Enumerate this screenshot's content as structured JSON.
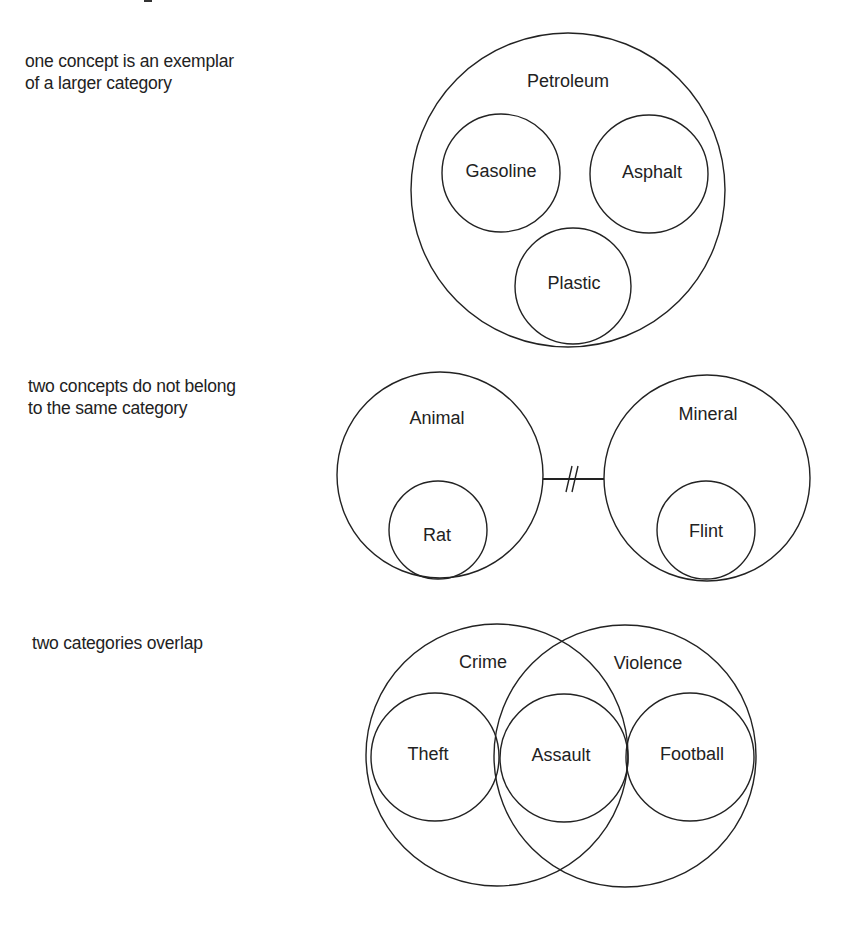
{
  "panels": [
    {
      "id": "exemplar",
      "caption": [
        "one concept is an exemplar",
        "of a larger category"
      ],
      "category": "Petroleum",
      "members": [
        "Gasoline",
        "Asphalt",
        "Plastic"
      ]
    },
    {
      "id": "disjoint",
      "caption": [
        "two concepts do not belong",
        "to the same category"
      ],
      "categories": [
        {
          "label": "Animal",
          "member": "Rat"
        },
        {
          "label": "Mineral",
          "member": "Flint"
        }
      ],
      "connector": "break-symbol"
    },
    {
      "id": "overlap",
      "caption": [
        "two categories overlap"
      ],
      "categories": [
        "Crime",
        "Violence"
      ],
      "members": [
        "Theft",
        "Assault",
        "Football"
      ]
    }
  ],
  "colors": {
    "line": "#222222",
    "text": "#222222",
    "background": "#ffffff"
  }
}
